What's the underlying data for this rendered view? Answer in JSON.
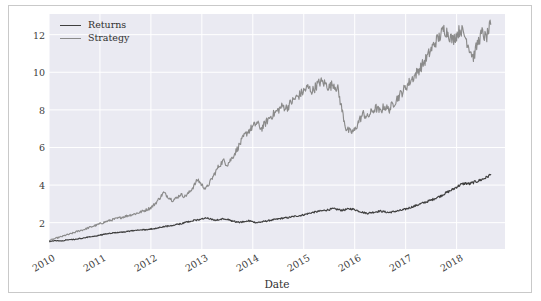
{
  "chart_data": {
    "type": "line",
    "title": "",
    "xlabel": "Date",
    "ylabel": "",
    "grid": true,
    "legend_position": "upper left",
    "xlim": [
      "2010-01-01",
      "2018-12-31"
    ],
    "ylim": [
      0.6,
      13.1
    ],
    "yticks": [
      2,
      4,
      6,
      8,
      10,
      12
    ],
    "ytick_labels": [
      "2",
      "4",
      "6",
      "8",
      "10",
      "12"
    ],
    "xticks": [
      "2010",
      "2011",
      "2012",
      "2013",
      "2014",
      "2015",
      "2016",
      "2017",
      "2018"
    ],
    "xtick_labels": [
      "2010",
      "2011",
      "2012",
      "2013",
      "2014",
      "2015",
      "2016",
      "2017",
      "2018"
    ],
    "colors": {
      "returns": "#3f3f3f",
      "strategy": "#8b8b8b",
      "plot_background": "#eaeaf2",
      "grid": "#ffffff",
      "figure_background": "#ffffff",
      "figure_border": "#c9c9c9",
      "tick_text": "#3b3b3b"
    },
    "series": [
      {
        "name": "Returns",
        "color": "#3f3f3f",
        "x": [
          2010.0,
          2010.08,
          2010.17,
          2010.25,
          2010.33,
          2010.42,
          2010.5,
          2010.58,
          2010.67,
          2010.75,
          2010.83,
          2010.92,
          2011.0,
          2011.08,
          2011.17,
          2011.25,
          2011.33,
          2011.42,
          2011.5,
          2011.58,
          2011.67,
          2011.75,
          2011.83,
          2011.92,
          2012.0,
          2012.08,
          2012.17,
          2012.25,
          2012.33,
          2012.42,
          2012.5,
          2012.58,
          2012.67,
          2012.75,
          2012.83,
          2012.92,
          2013.0,
          2013.08,
          2013.17,
          2013.25,
          2013.33,
          2013.42,
          2013.5,
          2013.58,
          2013.67,
          2013.75,
          2013.83,
          2013.92,
          2014.0,
          2014.08,
          2014.17,
          2014.25,
          2014.33,
          2014.42,
          2014.5,
          2014.58,
          2014.67,
          2014.75,
          2014.83,
          2014.92,
          2015.0,
          2015.08,
          2015.17,
          2015.25,
          2015.33,
          2015.42,
          2015.5,
          2015.58,
          2015.67,
          2015.75,
          2015.83,
          2015.92,
          2016.0,
          2016.08,
          2016.17,
          2016.25,
          2016.33,
          2016.42,
          2016.5,
          2016.58,
          2016.67,
          2016.75,
          2016.83,
          2016.92,
          2017.0,
          2017.08,
          2017.17,
          2017.25,
          2017.33,
          2017.42,
          2017.5,
          2017.58,
          2017.67,
          2017.75,
          2017.83,
          2017.92,
          2018.0,
          2018.08,
          2018.17,
          2018.25,
          2018.33,
          2018.42,
          2018.5,
          2018.58,
          2018.67
        ],
        "y": [
          1.0,
          1.03,
          1.05,
          1.02,
          1.08,
          1.12,
          1.1,
          1.15,
          1.18,
          1.22,
          1.26,
          1.3,
          1.34,
          1.38,
          1.42,
          1.45,
          1.47,
          1.5,
          1.52,
          1.55,
          1.58,
          1.6,
          1.62,
          1.64,
          1.66,
          1.7,
          1.74,
          1.78,
          1.82,
          1.86,
          1.9,
          1.94,
          2.0,
          2.06,
          2.12,
          2.14,
          2.2,
          2.26,
          2.2,
          2.12,
          2.16,
          2.22,
          2.18,
          2.1,
          2.05,
          2.02,
          2.06,
          2.1,
          2.05,
          2.0,
          2.04,
          2.08,
          2.12,
          2.16,
          2.2,
          2.24,
          2.26,
          2.3,
          2.34,
          2.38,
          2.42,
          2.48,
          2.54,
          2.58,
          2.62,
          2.66,
          2.7,
          2.74,
          2.7,
          2.66,
          2.7,
          2.74,
          2.7,
          2.62,
          2.54,
          2.5,
          2.54,
          2.58,
          2.62,
          2.58,
          2.54,
          2.58,
          2.62,
          2.66,
          2.72,
          2.8,
          2.88,
          2.96,
          3.04,
          3.12,
          3.2,
          3.3,
          3.4,
          3.52,
          3.64,
          3.76,
          3.9,
          4.02,
          4.1,
          4.06,
          4.14,
          4.22,
          4.3,
          4.4,
          4.56
        ]
      },
      {
        "name": "Strategy",
        "color": "#8b8b8b",
        "x": [
          2010.0,
          2010.08,
          2010.17,
          2010.25,
          2010.33,
          2010.42,
          2010.5,
          2010.58,
          2010.67,
          2010.75,
          2010.83,
          2010.92,
          2011.0,
          2011.08,
          2011.17,
          2011.25,
          2011.33,
          2011.42,
          2011.5,
          2011.58,
          2011.67,
          2011.75,
          2011.83,
          2011.92,
          2012.0,
          2012.08,
          2012.17,
          2012.25,
          2012.33,
          2012.42,
          2012.5,
          2012.58,
          2012.67,
          2012.75,
          2012.83,
          2012.92,
          2013.0,
          2013.08,
          2013.17,
          2013.25,
          2013.33,
          2013.42,
          2013.5,
          2013.58,
          2013.67,
          2013.75,
          2013.83,
          2013.92,
          2014.0,
          2014.08,
          2014.17,
          2014.25,
          2014.33,
          2014.42,
          2014.5,
          2014.58,
          2014.67,
          2014.75,
          2014.83,
          2014.92,
          2015.0,
          2015.08,
          2015.17,
          2015.25,
          2015.33,
          2015.42,
          2015.5,
          2015.58,
          2015.67,
          2015.75,
          2015.83,
          2015.92,
          2016.0,
          2016.08,
          2016.17,
          2016.25,
          2016.33,
          2016.42,
          2016.5,
          2016.58,
          2016.67,
          2016.75,
          2016.83,
          2016.92,
          2017.0,
          2017.08,
          2017.17,
          2017.25,
          2017.33,
          2017.42,
          2017.5,
          2017.58,
          2017.67,
          2017.75,
          2017.83,
          2017.92,
          2018.0,
          2018.08,
          2018.17,
          2018.25,
          2018.33,
          2018.42,
          2018.5,
          2018.58,
          2018.67
        ],
        "y": [
          1.05,
          1.12,
          1.2,
          1.26,
          1.34,
          1.4,
          1.48,
          1.56,
          1.62,
          1.7,
          1.78,
          1.86,
          1.94,
          2.02,
          2.1,
          2.16,
          2.22,
          2.28,
          2.34,
          2.4,
          2.46,
          2.52,
          2.6,
          2.7,
          2.8,
          3.0,
          3.3,
          3.6,
          3.4,
          3.2,
          3.3,
          3.5,
          3.4,
          3.6,
          3.9,
          4.3,
          4.0,
          3.8,
          4.2,
          4.6,
          5.0,
          5.3,
          5.1,
          5.4,
          5.8,
          6.2,
          6.6,
          6.9,
          7.1,
          7.3,
          7.0,
          7.3,
          7.6,
          7.8,
          8.0,
          8.2,
          8.1,
          8.4,
          8.6,
          8.8,
          9.0,
          9.2,
          9.0,
          9.3,
          9.5,
          9.4,
          9.2,
          9.4,
          9.1,
          8.0,
          7.0,
          6.8,
          6.9,
          7.4,
          7.8,
          7.6,
          7.9,
          8.1,
          7.9,
          8.2,
          8.0,
          8.3,
          8.6,
          8.9,
          9.2,
          9.5,
          9.8,
          10.1,
          10.4,
          10.8,
          11.2,
          11.6,
          11.9,
          12.3,
          12.1,
          11.7,
          12.0,
          12.3,
          11.9,
          11.3,
          10.8,
          11.6,
          12.1,
          11.8,
          12.55
        ]
      }
    ]
  },
  "legend": {
    "items": [
      {
        "label": "Returns",
        "color": "#3f3f3f"
      },
      {
        "label": "Strategy",
        "color": "#8b8b8b"
      }
    ]
  }
}
